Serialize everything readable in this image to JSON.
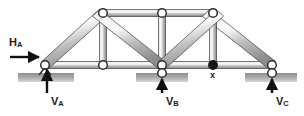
{
  "figure": {
    "type": "statics-truss-free-body-diagram",
    "title": "",
    "background_color": "#ffffff",
    "member_fill_light": "#f2f2f2",
    "member_fill_dark": "#9a9a9a",
    "outline_color": "#3a3a3a",
    "ground_color_dark": "#8d8d8d",
    "ground_color_light": "#d8d8d8",
    "arrow_color": "#111111",
    "joint_fill": "#ffffff",
    "loaded_joint_fill": "#141414"
  },
  "labels": {
    "h_a": {
      "text": "H",
      "sub": "A",
      "x": 10,
      "y": 41
    },
    "v_a": {
      "text": "V",
      "sub": "A",
      "x": 47,
      "y": 98
    },
    "v_b": {
      "text": "V",
      "sub": "B",
      "x": 164,
      "y": 97
    },
    "v_c": {
      "text": "V",
      "sub": "C",
      "x": 271,
      "y": 97
    },
    "x_point": {
      "text": "x",
      "x": 210,
      "y": 70
    }
  },
  "joints": {
    "bottom": [
      {
        "name": "A",
        "x": 45,
        "y": 65,
        "type": "pin-support",
        "filled": false
      },
      {
        "name": "D",
        "x": 103,
        "y": 65,
        "type": "open",
        "filled": false
      },
      {
        "name": "B",
        "x": 162,
        "y": 65,
        "type": "roller-support",
        "filled": false
      },
      {
        "name": "x",
        "x": 213,
        "y": 65,
        "type": "load-point",
        "filled": true
      },
      {
        "name": "C",
        "x": 272,
        "y": 65,
        "type": "roller-support",
        "filled": false
      }
    ],
    "top": [
      {
        "name": "E",
        "x": 103,
        "y": 13,
        "filled": false
      },
      {
        "name": "F",
        "x": 162,
        "y": 13,
        "filled": false
      },
      {
        "name": "G",
        "x": 213,
        "y": 13,
        "filled": false
      }
    ]
  },
  "members": [
    {
      "from": "A",
      "to": "E",
      "kind": "end-diagonal-left"
    },
    {
      "from": "E",
      "to": "F",
      "kind": "top-chord"
    },
    {
      "from": "F",
      "to": "G",
      "kind": "top-chord"
    },
    {
      "from": "G",
      "to": "C",
      "kind": "end-diagonal-right"
    },
    {
      "from": "A",
      "to": "D",
      "kind": "bottom-chord"
    },
    {
      "from": "D",
      "to": "B",
      "kind": "bottom-chord"
    },
    {
      "from": "B",
      "to": "x",
      "kind": "bottom-chord"
    },
    {
      "from": "x",
      "to": "C",
      "kind": "bottom-chord"
    },
    {
      "from": "E",
      "to": "D",
      "kind": "vertical"
    },
    {
      "from": "F",
      "to": "B",
      "kind": "vertical"
    },
    {
      "from": "G",
      "to": "x",
      "kind": "vertical"
    },
    {
      "from": "E",
      "to": "B",
      "kind": "diagonal"
    },
    {
      "from": "G",
      "to": "B",
      "kind": "diagonal"
    }
  ],
  "supports": [
    {
      "at": "A",
      "type": "pin",
      "ground_x": 18,
      "ground_y": 73,
      "ground_w": 56,
      "ground_h": 9
    },
    {
      "at": "B",
      "type": "roller",
      "ground_x": 136,
      "ground_y": 73,
      "ground_w": 52,
      "ground_h": 9
    },
    {
      "at": "C",
      "type": "roller",
      "ground_x": 245,
      "ground_y": 73,
      "ground_w": 52,
      "ground_h": 9
    }
  ],
  "reaction_arrows": [
    {
      "name": "H_A",
      "direction": "right",
      "from_x": 10,
      "from_y": 57,
      "to_x": 41,
      "to_y": 57
    },
    {
      "name": "V_A",
      "direction": "up",
      "from_x": 47,
      "from_y": 92,
      "to_x": 47,
      "to_y": 69
    },
    {
      "name": "V_B",
      "direction": "up",
      "from_x": 162,
      "from_y": 92,
      "to_x": 162,
      "to_y": 73
    },
    {
      "name": "V_C",
      "direction": "up",
      "from_x": 272,
      "from_y": 92,
      "to_x": 272,
      "to_y": 73
    }
  ]
}
